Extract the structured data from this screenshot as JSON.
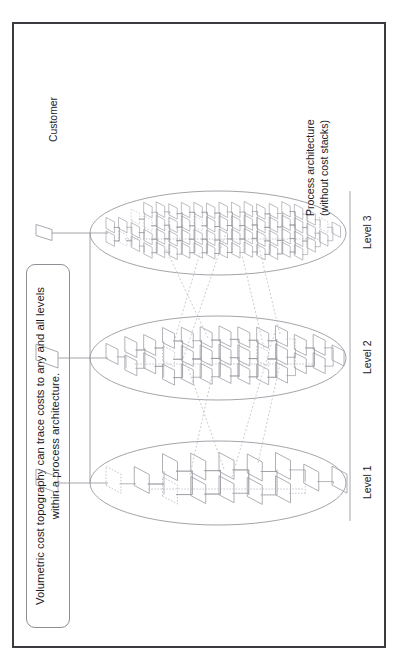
{
  "slide": {
    "background_color": "#ffffff",
    "frame_color": "#3b3b40"
  },
  "title": {
    "text": "Volumetric cost topography can trace costs to any and all levels within a process architecture."
  },
  "caption": {
    "line1": "Process architecture",
    "line2": "(without cost stacks)"
  },
  "diagram": {
    "type": "process-architecture-levels",
    "line_color": "#9a9aa2",
    "dash_color": "#b9b9c0",
    "top_connector_color": "#9a9aa2",
    "baseline_color": "#9a9aa2",
    "customer_label": "Customer",
    "levels": [
      {
        "id": "level-1",
        "label": "Level 1",
        "node_count": 17,
        "density": "low",
        "cx": 165
      },
      {
        "id": "level-2",
        "label": "Level 2",
        "node_count": 34,
        "density": "medium",
        "cx": 290
      },
      {
        "id": "level-3",
        "label": "Level 3",
        "node_count": 72,
        "density": "high",
        "cx": 415
      }
    ]
  }
}
